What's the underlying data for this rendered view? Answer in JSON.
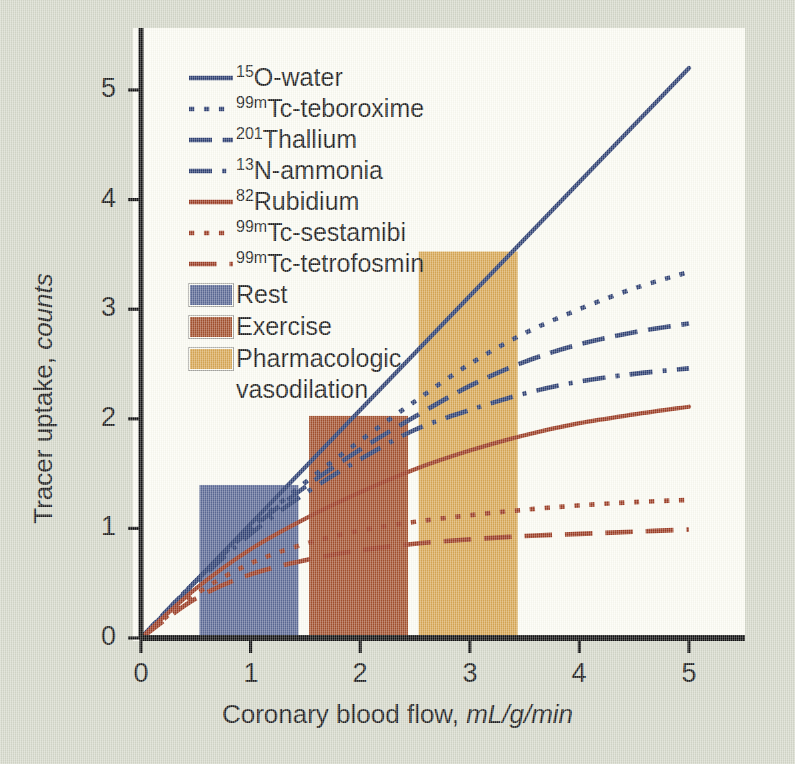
{
  "figure": {
    "background_color": "#d6d9cb",
    "panel_color": "#fdfdf4",
    "axis_color": "#111111"
  },
  "chart_data": {
    "type": "line",
    "title": "",
    "xlabel_text": "Coronary blood flow, ",
    "xlabel_units": "mL/g/min",
    "ylabel_text": "Tracer uptake, ",
    "ylabel_units": "counts",
    "xlim": [
      0,
      5.6
    ],
    "ylim": [
      0,
      5.45
    ],
    "xticks": [
      "0",
      "1",
      "2",
      "3",
      "4",
      "5"
    ],
    "yticks": [
      "0",
      "1",
      "2",
      "3",
      "4",
      "5"
    ],
    "grid": false,
    "legend_position": "upper-left-inside",
    "series": [
      {
        "name": "15O-water",
        "label_sup": "15",
        "label_rest": "O-water",
        "color": "#2d3f72",
        "dash": "none",
        "x": [
          0,
          0.5,
          1,
          1.5,
          2,
          2.5,
          3,
          3.5,
          4,
          4.5,
          5
        ],
        "y": [
          0,
          0.52,
          1.04,
          1.56,
          2.08,
          2.6,
          3.12,
          3.64,
          4.16,
          4.68,
          5.2
        ]
      },
      {
        "name": "99mTc-teboroxime",
        "label_sup": "99m",
        "label_rest": "Tc-teboroxime",
        "color": "#2d3f72",
        "dash": "dotted",
        "x": [
          0,
          0.5,
          1,
          1.5,
          2,
          2.5,
          3,
          3.5,
          4,
          4.5,
          5
        ],
        "y": [
          0,
          0.52,
          1.0,
          1.42,
          1.8,
          2.16,
          2.5,
          2.78,
          3.0,
          3.19,
          3.34
        ]
      },
      {
        "name": "201Thallium",
        "label_sup": "201",
        "label_rest": "Thallium",
        "color": "#2d3f72",
        "dash": "dashed",
        "x": [
          0,
          0.5,
          1,
          1.5,
          2,
          2.5,
          3,
          3.5,
          4,
          4.5,
          5
        ],
        "y": [
          0,
          0.52,
          0.99,
          1.38,
          1.72,
          2.02,
          2.3,
          2.52,
          2.68,
          2.79,
          2.87
        ]
      },
      {
        "name": "13N-ammonia",
        "label_sup": "13",
        "label_rest": "N-ammonia",
        "color": "#2d3f72",
        "dash": "dashdot",
        "x": [
          0,
          0.5,
          1,
          1.5,
          2,
          2.5,
          3,
          3.5,
          4,
          4.5,
          5
        ],
        "y": [
          0,
          0.5,
          0.95,
          1.32,
          1.63,
          1.9,
          2.08,
          2.23,
          2.34,
          2.41,
          2.46
        ]
      },
      {
        "name": "82Rubidium",
        "label_sup": "82",
        "label_rest": "Rubidium",
        "color": "#9c3b22",
        "dash": "none",
        "x": [
          0,
          0.5,
          1,
          1.5,
          2,
          2.5,
          3,
          3.5,
          4,
          4.5,
          5
        ],
        "y": [
          0,
          0.45,
          0.81,
          1.09,
          1.33,
          1.54,
          1.71,
          1.85,
          1.96,
          2.04,
          2.11
        ]
      },
      {
        "name": "99mTc-sestamibi",
        "label_sup": "99m",
        "label_rest": "Tc-sestamibi",
        "color": "#9c3b22",
        "dash": "dotted",
        "x": [
          0,
          0.5,
          1,
          1.5,
          2,
          2.5,
          3,
          3.5,
          4,
          4.5,
          5
        ],
        "y": [
          0,
          0.4,
          0.68,
          0.86,
          0.98,
          1.06,
          1.12,
          1.17,
          1.21,
          1.24,
          1.26
        ]
      },
      {
        "name": "99mTc-tetrofosmin",
        "label_sup": "99m",
        "label_rest": "Tc-tetrofosmin",
        "color": "#9c3b22",
        "dash": "longdash",
        "x": [
          0,
          0.5,
          1,
          1.5,
          2,
          2.5,
          3,
          3.5,
          4,
          4.5,
          5
        ],
        "y": [
          0,
          0.36,
          0.58,
          0.71,
          0.8,
          0.86,
          0.9,
          0.93,
          0.95,
          0.97,
          0.99
        ]
      }
    ],
    "bars": [
      {
        "name": "Rest",
        "label": "Rest",
        "x_start": 0.52,
        "x_end": 1.45,
        "value": 1.41,
        "color": "#5c6a96"
      },
      {
        "name": "Exercise",
        "label": "Exercise",
        "x_start": 1.52,
        "x_end": 2.45,
        "value": 2.04,
        "color": "#a4512e"
      },
      {
        "name": "Pharmacologic vasodilation",
        "label": "Pharmacologic",
        "label2": "vasodilation",
        "x_start": 2.52,
        "x_end": 3.45,
        "value": 3.54,
        "color": "#d9a855"
      }
    ]
  }
}
